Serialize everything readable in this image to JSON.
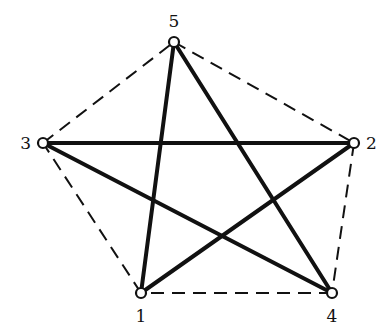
{
  "diagram": {
    "type": "graph",
    "colors": {
      "line": "#111111",
      "node_fill": "#ffffff",
      "background": "#ffffff"
    },
    "nodes": [
      {
        "id": "1",
        "label": "1",
        "x": 141,
        "y": 293,
        "label_x": 141,
        "label_y": 322,
        "anchor": "middle"
      },
      {
        "id": "2",
        "label": "2",
        "x": 354,
        "y": 143,
        "label_x": 366,
        "label_y": 149,
        "anchor": "start"
      },
      {
        "id": "3",
        "label": "3",
        "x": 43,
        "y": 143,
        "label_x": 31,
        "label_y": 149,
        "anchor": "end"
      },
      {
        "id": "4",
        "label": "4",
        "x": 332,
        "y": 293,
        "label_x": 332,
        "label_y": 322,
        "anchor": "middle"
      },
      {
        "id": "5",
        "label": "5",
        "x": 174,
        "y": 42,
        "label_x": 174,
        "label_y": 27,
        "anchor": "middle"
      }
    ],
    "solid_edges": [
      {
        "from": "1",
        "to": "5"
      },
      {
        "from": "5",
        "to": "4"
      },
      {
        "from": "4",
        "to": "3"
      },
      {
        "from": "3",
        "to": "2"
      },
      {
        "from": "2",
        "to": "1"
      }
    ],
    "dashed_edges": [
      {
        "from": "5",
        "to": "2"
      },
      {
        "from": "2",
        "to": "4"
      },
      {
        "from": "4",
        "to": "1"
      },
      {
        "from": "1",
        "to": "3"
      },
      {
        "from": "3",
        "to": "5"
      }
    ]
  }
}
